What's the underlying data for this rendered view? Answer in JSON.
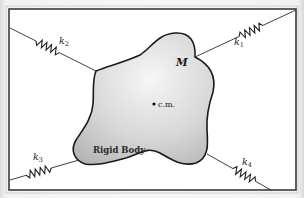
{
  "diagram": {
    "frame": {
      "x": 9,
      "y": 9,
      "width": 287,
      "height": 181
    },
    "body": {
      "label": "M",
      "caption": "Rigid Body",
      "center_of_mass_label": "c.m.",
      "center_of_mass": {
        "x": 154,
        "y": 104
      },
      "fill_top": "#f4f4f4",
      "fill_bottom": "#b9b9b9",
      "outline": "#1a1a1a"
    },
    "springs": [
      {
        "id": "k1",
        "symbol": "k",
        "subscript": "1",
        "from": {
          "x": 296,
          "y": 10
        },
        "to": {
          "x": 195,
          "y": 57
        },
        "label_pos": {
          "x": 234,
          "y": 45
        }
      },
      {
        "id": "k2",
        "symbol": "k",
        "subscript": "2",
        "from": {
          "x": 10,
          "y": 28
        },
        "to": {
          "x": 96,
          "y": 71
        },
        "label_pos": {
          "x": 59,
          "y": 44
        }
      },
      {
        "id": "k3",
        "symbol": "k",
        "subscript": "3",
        "from": {
          "x": 10,
          "y": 180
        },
        "to": {
          "x": 79,
          "y": 160
        },
        "label_pos": {
          "x": 33,
          "y": 160
        }
      },
      {
        "id": "k4",
        "symbol": "k",
        "subscript": "4",
        "from": {
          "x": 271,
          "y": 190
        },
        "to": {
          "x": 207,
          "y": 154
        },
        "label_pos": {
          "x": 242,
          "y": 165
        }
      }
    ]
  }
}
